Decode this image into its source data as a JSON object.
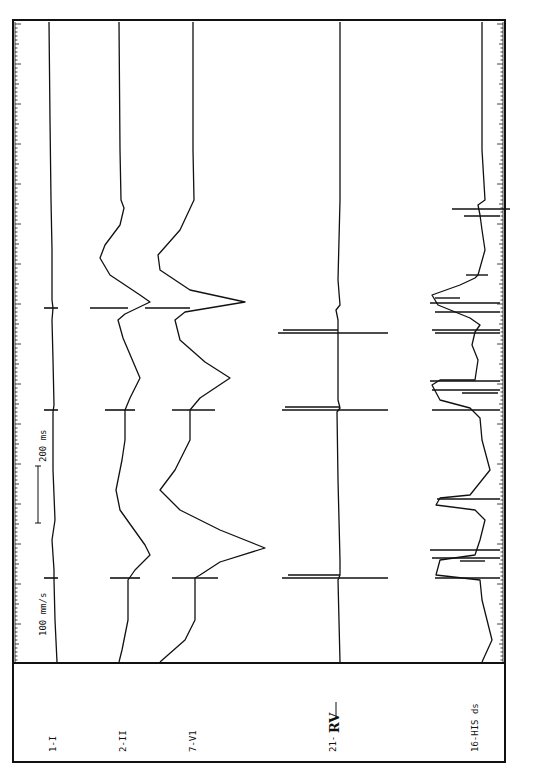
{
  "chart_data": {
    "type": "line",
    "title": "",
    "orientation": "rotated-90-clockwise (time runs bottom-to-top)",
    "paper_speed": "100 mm/s",
    "scale_bar": {
      "label": "200 ms",
      "duration_ms": 200
    },
    "channels": [
      {
        "id": "1-I",
        "label": "1-I",
        "type": "surface ECG lead I"
      },
      {
        "id": "2-II",
        "label": "2-II",
        "type": "surface ECG lead II"
      },
      {
        "id": "7-V1",
        "label": "7-V1",
        "type": "surface ECG lead V1"
      },
      {
        "id": "21-RV",
        "label_prefix": "21-",
        "label_handwritten": "RV",
        "type": "intracardiac right ventricle"
      },
      {
        "id": "16-HIS-ds",
        "label": "16-HIS ds",
        "type": "intracardiac His bundle distal"
      }
    ],
    "beats": [
      {
        "index": 1,
        "pacing_spike_y": 578,
        "note": "paced complex with wide QRS"
      },
      {
        "index": 2,
        "pacing_spike_y": 410,
        "note": "paced complex"
      },
      {
        "index": 3,
        "pacing_spike_y": 308,
        "note": "paced complex"
      }
    ],
    "grid": false,
    "legend": "left-side label panel"
  },
  "labels": {
    "speed": "100 mm/s",
    "scale": "200 ms",
    "ch1": "1-I",
    "ch2": "2-II",
    "ch3": "7-V1",
    "ch4_prefix": "21-",
    "ch4_hand": "RV",
    "ch5": "16-HIS ds"
  }
}
